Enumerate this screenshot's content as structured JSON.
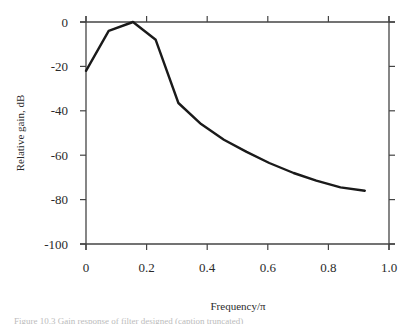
{
  "chart_data": {
    "type": "line",
    "title": "",
    "xlabel": "Frequency/π",
    "ylabel": "Relative gain, dB",
    "xlim": [
      0,
      1.0
    ],
    "ylim": [
      -100,
      0
    ],
    "x_ticks": [
      0,
      0.2,
      0.4,
      0.6,
      0.8,
      1.0
    ],
    "x_tick_labels": [
      "0",
      "0.2",
      "0.4",
      "0.6",
      "0.8",
      "1.0"
    ],
    "y_ticks": [
      0,
      -20,
      -40,
      -60,
      -80,
      -100
    ],
    "y_tick_labels": [
      "0",
      "-20",
      "-40",
      "-60",
      "-80",
      "-100"
    ],
    "grid": false,
    "legend": null,
    "frame": "box with outward ticks on all four sides",
    "series": [
      {
        "name": "Relative gain",
        "color": "#1a1a1a",
        "x": [
          0,
          0.075,
          0.155,
          0.23,
          0.305,
          0.38,
          0.455,
          0.53,
          0.605,
          0.685,
          0.76,
          0.84,
          0.92
        ],
        "y": [
          -22,
          -4,
          0,
          -8,
          -36.5,
          -46,
          -53,
          -58.5,
          -63.5,
          -68,
          -71.5,
          -74.5,
          -76
        ]
      }
    ]
  },
  "labels": {
    "xlabel": "Frequency/π",
    "ylabel": "Relative gain, dB",
    "caption": "Figure 10.3  Gain response of filter designed (caption truncated)"
  }
}
